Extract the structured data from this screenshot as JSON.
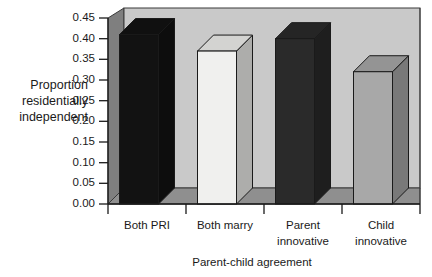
{
  "chart_data": {
    "type": "bar",
    "title": "",
    "xlabel": "Parent-child agreement",
    "ylabel": "Proportion residentially independent",
    "ylabel_lines": [
      "Proportion",
      "residentially",
      "independent"
    ],
    "categories": [
      "Both PRI",
      "Both marry",
      "Parent innovative",
      "Child innovative"
    ],
    "category_lines": [
      [
        "Both PRI"
      ],
      [
        "Both marry"
      ],
      [
        "Parent",
        "innovative"
      ],
      [
        "Child",
        "innovative"
      ]
    ],
    "values": [
      0.41,
      0.37,
      0.4,
      0.32
    ],
    "ylim": [
      0.0,
      0.45
    ],
    "ytick_values": [
      0.45,
      0.4,
      0.35,
      0.3,
      0.25,
      0.2,
      0.15,
      0.1,
      0.05,
      0.0
    ],
    "ytick_labels": [
      "0.45",
      "0.40",
      "0.35",
      "0.30",
      "0.25",
      "0.20",
      "0.15",
      "0.10",
      "0.05",
      "0.00"
    ],
    "grid": false,
    "legend": "none",
    "style": "3d-bar",
    "bar_colors": [
      "#121212",
      "#f0f0ee",
      "#2a2a2a",
      "#a8a8a8"
    ],
    "plot_background": "#c9c9c9",
    "wall_color": "#8c8c8c",
    "floor_color": "#8f8f8f"
  }
}
